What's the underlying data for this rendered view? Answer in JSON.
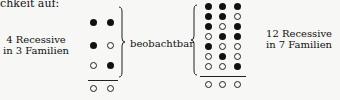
{
  "header": {
    "text": "chkeit auf:"
  },
  "left": {
    "label_line1": "4 Recessive",
    "label_line2": "in 3 Familien",
    "rows": [
      [
        "f",
        "f"
      ],
      [
        "f",
        "o"
      ],
      [
        "o",
        "f"
      ]
    ],
    "bottom": [
      "o",
      "o"
    ]
  },
  "middle": {
    "label": "beobachtbar"
  },
  "right": {
    "label_line1": "12 Recessive",
    "label_line2": "in 7 Familien",
    "rows": [
      [
        "f",
        "f",
        "f"
      ],
      [
        "f",
        "f",
        "o"
      ],
      [
        "f",
        "o",
        "f"
      ],
      [
        "o",
        "f",
        "f"
      ],
      [
        "f",
        "o",
        "o"
      ],
      [
        "o",
        "f",
        "o"
      ],
      [
        "o",
        "o",
        "f"
      ]
    ],
    "bottom": [
      "o",
      "o",
      "o"
    ]
  }
}
